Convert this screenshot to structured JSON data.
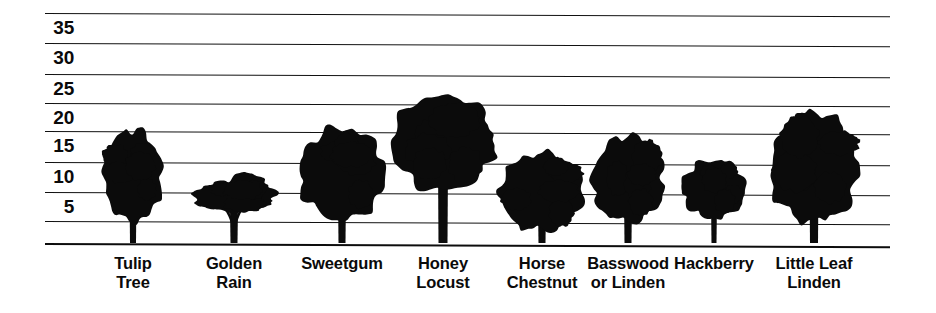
{
  "chart_data": {
    "type": "bar",
    "title": "",
    "subtitle": "",
    "xlabel": "",
    "ylabel": "",
    "grid": true,
    "legend": null,
    "ylim": [
      0,
      37.5
    ],
    "yticks": [
      35,
      30,
      25,
      20,
      15,
      10,
      5
    ],
    "ytick_labels": [
      "35",
      "30",
      "25",
      "20",
      "15",
      "10",
      "5"
    ],
    "units": "feet",
    "categories": [
      "Tulip Tree",
      "Golden Rain",
      "Sweetgum",
      "Honey Locust",
      "Horse Chestnut",
      "Basswood or Linden",
      "Hackberry",
      "Little Leaf Linden"
    ],
    "values": [
      16,
      11,
      17,
      23,
      13,
      17,
      12,
      23
    ],
    "series": [
      {
        "name": "Mature tree height",
        "values": [
          16,
          11,
          17,
          23,
          13,
          17,
          12,
          23
        ]
      }
    ]
  },
  "axis": {
    "ticks": [
      {
        "label": "35",
        "value": 35,
        "y": 13
      },
      {
        "label": "30",
        "value": 30,
        "y": 43
      },
      {
        "label": "25",
        "value": 25,
        "y": 74
      },
      {
        "label": "20",
        "value": 20,
        "y": 103
      },
      {
        "label": "15",
        "value": 15,
        "y": 131
      },
      {
        "label": "10",
        "value": 10,
        "y": 162
      },
      {
        "label": "5",
        "value": 5,
        "y": 192
      }
    ],
    "baseline_y": 221,
    "bottom_rule_y": 243
  },
  "trees": [
    {
      "name": "tulip-tree",
      "label_lines": [
        "Tulip",
        "Tree"
      ],
      "value": 16,
      "center_x": 133,
      "crown_width": 66,
      "crown_height": 92,
      "trunk_height": 22
    },
    {
      "name": "golden-rain",
      "label_lines": [
        "Golden",
        "Rain"
      ],
      "value": 11,
      "center_x": 234,
      "crown_width": 82,
      "crown_height": 49,
      "trunk_height": 22
    },
    {
      "name": "sweetgum",
      "label_lines": [
        "Sweetgum"
      ],
      "value": 17,
      "center_x": 342,
      "crown_width": 86,
      "crown_height": 94,
      "trunk_height": 22
    },
    {
      "name": "honey-locust",
      "label_lines": [
        "Honey",
        "Locust"
      ],
      "value": 23,
      "center_x": 443,
      "crown_width": 102,
      "crown_height": 97,
      "trunk_height": 52
    },
    {
      "name": "horse-chestnut",
      "label_lines": [
        "Horse",
        "Chestnut"
      ],
      "value": 13,
      "center_x": 542,
      "crown_width": 86,
      "crown_height": 78,
      "trunk_height": 12
    },
    {
      "name": "basswood-or-linden",
      "label_lines": [
        "Basswood",
        "or Linden"
      ],
      "value": 17,
      "center_x": 628,
      "crown_width": 78,
      "crown_height": 86,
      "trunk_height": 22
    },
    {
      "name": "hackberry",
      "label_lines": [
        "Hackberry"
      ],
      "value": 12,
      "center_x": 714,
      "crown_width": 64,
      "crown_height": 60,
      "trunk_height": 24
    },
    {
      "name": "little-leaf-linden",
      "label_lines": [
        "Little Leaf",
        "Linden"
      ],
      "value": 23,
      "center_x": 814,
      "crown_width": 94,
      "crown_height": 110,
      "trunk_height": 22
    }
  ],
  "colors": {
    "ink": "#111111",
    "silhouette": "#0b0b0b",
    "background": "#ffffff"
  }
}
